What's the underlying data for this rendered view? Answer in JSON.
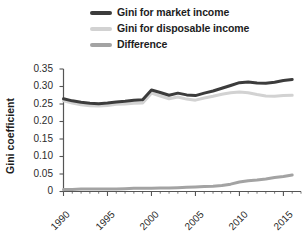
{
  "legend": {
    "position": "top-center",
    "items": [
      {
        "label": "Gini for market income",
        "color": "#3c3c3c",
        "swatch": "legend-swatch-market-income"
      },
      {
        "label": "Gini for disposable income",
        "color": "#d2d2d2",
        "swatch": "legend-swatch-disposable-income"
      },
      {
        "label": "Difference",
        "color": "#a3a3a3",
        "swatch": "legend-swatch-difference"
      }
    ]
  },
  "axes": {
    "ylabel": "Gini coefficient",
    "xlabel": "",
    "yticks": [
      "0.35",
      "0.30",
      "0.25",
      "0.20",
      "0.15",
      "0.10",
      "0.05",
      "0"
    ],
    "xticks": [
      "1990",
      "1995",
      "2000",
      "2005",
      "2010",
      "2015"
    ]
  },
  "chart_data": {
    "type": "line",
    "title": "",
    "subtitle": "",
    "xlabel": "",
    "ylabel": "Gini coefficient",
    "xlim": [
      1990,
      2017
    ],
    "ylim": [
      0,
      0.35
    ],
    "ytick_values": [
      0,
      0.05,
      0.1,
      0.15,
      0.2,
      0.25,
      0.3,
      0.35
    ],
    "xtick_values": [
      1990,
      1995,
      2000,
      2005,
      2010,
      2015
    ],
    "xminor_step": 1,
    "grid": false,
    "legend_position": "top-center",
    "x": [
      1990,
      1991,
      1992,
      1993,
      1994,
      1995,
      1996,
      1997,
      1998,
      1999,
      2000,
      2001,
      2002,
      2003,
      2004,
      2005,
      2006,
      2007,
      2008,
      2009,
      2010,
      2011,
      2012,
      2013,
      2014,
      2015,
      2016
    ],
    "series": [
      {
        "name": "Gini for market income",
        "color": "#3c3c3c",
        "values": [
          0.265,
          0.259,
          0.255,
          0.252,
          0.251,
          0.253,
          0.256,
          0.258,
          0.261,
          0.262,
          0.29,
          0.283,
          0.275,
          0.281,
          0.276,
          0.274,
          0.281,
          0.287,
          0.295,
          0.303,
          0.311,
          0.313,
          0.31,
          0.309,
          0.312,
          0.317,
          0.32
        ]
      },
      {
        "name": "Gini for disposable income",
        "color": "#d2d2d2",
        "values": [
          0.259,
          0.253,
          0.248,
          0.245,
          0.244,
          0.246,
          0.249,
          0.25,
          0.252,
          0.253,
          0.281,
          0.273,
          0.265,
          0.27,
          0.264,
          0.261,
          0.267,
          0.272,
          0.278,
          0.282,
          0.284,
          0.282,
          0.277,
          0.273,
          0.272,
          0.274,
          0.275
        ]
      },
      {
        "name": "Difference",
        "color": "#a3a3a3",
        "values": [
          0.006,
          0.006,
          0.007,
          0.007,
          0.007,
          0.007,
          0.007,
          0.008,
          0.009,
          0.009,
          0.009,
          0.01,
          0.01,
          0.011,
          0.012,
          0.013,
          0.014,
          0.015,
          0.017,
          0.021,
          0.027,
          0.031,
          0.033,
          0.036,
          0.04,
          0.043,
          0.047
        ]
      }
    ]
  }
}
